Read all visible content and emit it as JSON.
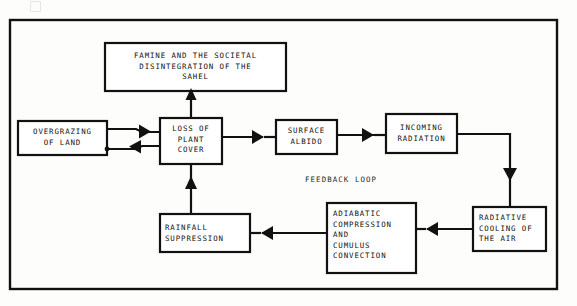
{
  "diagram": {
    "type": "flowchart",
    "title": "",
    "frame": {
      "x": 10,
      "y": 20,
      "width": 547,
      "height": 269,
      "stroke": "#111111",
      "stroke_width": 2.4
    },
    "loop_annotation": {
      "text": "FEEDBACK LOOP",
      "x": 305,
      "y": 175
    },
    "nodes": [
      {
        "id": "famine",
        "text": "FAMINE AND THE SOCIETAL\nDISINTEGRATION OF THE\nSAHEL",
        "align": "center",
        "x": 105,
        "y": 43,
        "width": 181,
        "height": 48
      },
      {
        "id": "overgrazing",
        "text": "OVERGRAZING\nOF LAND",
        "align": "center",
        "x": 18,
        "y": 121,
        "width": 89,
        "height": 34
      },
      {
        "id": "loss-of-plant-cover",
        "text": "LOSS OF\nPLANT\nCOVER",
        "align": "center",
        "x": 160,
        "y": 118,
        "width": 62,
        "height": 46
      },
      {
        "id": "surface-albido",
        "text": "SURFACE\nALBIDO",
        "align": "center",
        "x": 276,
        "y": 120,
        "width": 61,
        "height": 34
      },
      {
        "id": "incoming-radiation",
        "text": "INCOMING\nRADIATION",
        "align": "center",
        "x": 386,
        "y": 114,
        "width": 71,
        "height": 39
      },
      {
        "id": "radiative-cooling",
        "text": "RADIATIVE\nCOOLING OF\nTHE AIR",
        "align": "left",
        "x": 473,
        "y": 207,
        "width": 73,
        "height": 44
      },
      {
        "id": "adiabatic",
        "text": "ADIABATIC\nCOMPRESSION\nAND\nCUMULUS\nCONVECTION",
        "align": "left",
        "x": 327,
        "y": 203,
        "width": 89,
        "height": 70
      },
      {
        "id": "rainfall-suppression",
        "text": "RAINFALL\nSUPPRESSION",
        "align": "left",
        "x": 160,
        "y": 214,
        "width": 90,
        "height": 38
      }
    ],
    "edges": [
      {
        "id": "loss-to-famine",
        "from": "loss-of-plant-cover",
        "to": "famine",
        "direction": "up"
      },
      {
        "id": "overgrazing-to-loss",
        "from": "overgrazing",
        "to": "loss-of-plant-cover",
        "direction": "right"
      },
      {
        "id": "loss-to-overgrazing",
        "from": "loss-of-plant-cover",
        "to": "overgrazing",
        "direction": "left"
      },
      {
        "id": "loss-to-albido",
        "from": "loss-of-plant-cover",
        "to": "surface-albido",
        "direction": "right"
      },
      {
        "id": "albido-to-radiation",
        "from": "surface-albido",
        "to": "incoming-radiation",
        "direction": "right"
      },
      {
        "id": "radiation-to-cooling",
        "from": "incoming-radiation",
        "to": "radiative-cooling",
        "direction": "down"
      },
      {
        "id": "cooling-to-adiabatic",
        "from": "radiative-cooling",
        "to": "adiabatic",
        "direction": "left"
      },
      {
        "id": "adiabatic-to-rainfall",
        "from": "adiabatic",
        "to": "rainfall-suppression",
        "direction": "left"
      },
      {
        "id": "rainfall-to-loss",
        "from": "rainfall-suppression",
        "to": "loss-of-plant-cover",
        "direction": "up"
      }
    ]
  }
}
